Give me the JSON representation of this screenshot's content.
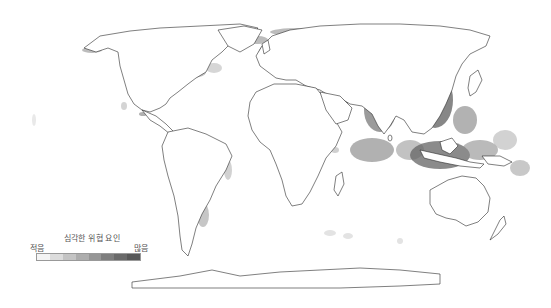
{
  "map": {
    "type": "world-choropleth",
    "projection": "robinson-like",
    "background_color": "#ffffff",
    "coastline_color": "#2a2a2a",
    "regions_high_threat": [
      "Europe",
      "Eastern North America / Great Lakes",
      "South Asia (India, Bay of Bengal)",
      "East Asia (China coast, South China Sea)",
      "Southeast Asia / Indonesia",
      "Eastern South America (Brazil, Argentina shelf)",
      "East Africa coast",
      "Persian Gulf"
    ]
  },
  "legend": {
    "title": "심각한 위협 요인",
    "low_label": "적음",
    "high_label": "많음",
    "scale_colors": [
      "#f4f4f4",
      "#dcdcdc",
      "#c4c4c4",
      "#adadad",
      "#969696",
      "#7e7e7e",
      "#6a6a6a",
      "#585858"
    ]
  }
}
